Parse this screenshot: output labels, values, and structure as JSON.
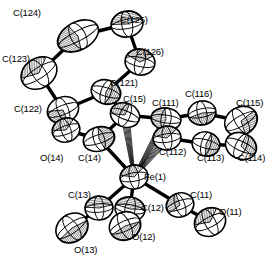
{
  "figure": {
    "kind": "ortep-crystal-structure-diagram",
    "title": "",
    "background_color": "#ffffff",
    "line_color": "#000000",
    "fill_color": "#ffffff",
    "width": 276,
    "height": 264,
    "ellipsoid_probability_note": ""
  },
  "atoms": [
    {
      "id": "C124",
      "label": "C(124)",
      "element": "C",
      "cx": 78,
      "cy": 36,
      "rx": 22,
      "ry": 14,
      "rot": -28,
      "hatch": "octant-left-dense",
      "label_x": 13,
      "label_y": 8,
      "label_anchor": "start"
    },
    {
      "id": "C125",
      "label": "C(125)",
      "element": "C",
      "cx": 127,
      "cy": 24,
      "rx": 16,
      "ry": 13,
      "rot": -10,
      "hatch": "octant-top-dense",
      "label_x": 120,
      "label_y": 15,
      "label_anchor": "start"
    },
    {
      "id": "C126",
      "label": "C(126)",
      "element": "C",
      "cx": 140,
      "cy": 62,
      "rx": 15,
      "ry": 13,
      "rot": 12,
      "hatch": "octant-center",
      "label_x": 136,
      "label_y": 47,
      "label_anchor": "start"
    },
    {
      "id": "C123",
      "label": "C(123)",
      "element": "C",
      "cx": 39,
      "cy": 73,
      "rx": 19,
      "ry": 15,
      "rot": -33,
      "hatch": "octant-center-dense",
      "label_x": 3,
      "label_y": 54,
      "label_anchor": "start"
    },
    {
      "id": "C122",
      "label": "C(122)",
      "element": "C",
      "cx": 63,
      "cy": 110,
      "rx": 16,
      "ry": 13,
      "rot": -22,
      "hatch": "octant-lower-left",
      "label_x": 14,
      "label_y": 104,
      "label_anchor": "start"
    },
    {
      "id": "C121",
      "label": "C(121)",
      "element": "C",
      "cx": 106,
      "cy": 92,
      "rx": 15,
      "ry": 12,
      "rot": 18,
      "hatch": "octant-right",
      "label_x": 110,
      "label_y": 78,
      "label_anchor": "start"
    },
    {
      "id": "C15",
      "label": "C(15)",
      "element": "C",
      "cx": 125,
      "cy": 115,
      "rx": 15,
      "ry": 12,
      "rot": 22,
      "hatch": "octant-upper-left",
      "label_x": 124,
      "label_y": 94,
      "label_anchor": "start"
    },
    {
      "id": "C111",
      "label": "C(111)",
      "element": "C",
      "cx": 166,
      "cy": 119,
      "rx": 15,
      "ry": 11,
      "rot": 8,
      "hatch": "octant-left-dense",
      "label_x": 152,
      "label_y": 98,
      "label_anchor": "start"
    },
    {
      "id": "C116",
      "label": "C(116)",
      "element": "C",
      "cx": 202,
      "cy": 113,
      "rx": 14,
      "ry": 12,
      "rot": -12,
      "hatch": "octant-lower-center",
      "label_x": 185,
      "label_y": 89,
      "label_anchor": "start"
    },
    {
      "id": "C115",
      "label": "C(115)",
      "element": "C",
      "cx": 241,
      "cy": 121,
      "rx": 17,
      "ry": 14,
      "rot": -30,
      "hatch": "octant-lower-right",
      "label_x": 236,
      "label_y": 98,
      "label_anchor": "start"
    },
    {
      "id": "C114",
      "label": "C(114)",
      "element": "C",
      "cx": 241,
      "cy": 146,
      "rx": 16,
      "ry": 13,
      "rot": 25,
      "hatch": "octant-upper-right",
      "label_x": 239,
      "label_y": 153,
      "label_anchor": "start"
    },
    {
      "id": "C113",
      "label": "C(113)",
      "element": "C",
      "cx": 206,
      "cy": 144,
      "rx": 14,
      "ry": 12,
      "rot": 15,
      "hatch": "octant-right-dense",
      "label_x": 198,
      "label_y": 153,
      "label_anchor": "start"
    },
    {
      "id": "C112",
      "label": "C(112)",
      "element": "C",
      "cx": 167,
      "cy": 138,
      "rx": 14,
      "ry": 12,
      "rot": -8,
      "hatch": "octant-center",
      "label_x": 160,
      "label_y": 147,
      "label_anchor": "start"
    },
    {
      "id": "C14",
      "label": "C(14)",
      "element": "C",
      "cx": 99,
      "cy": 139,
      "rx": 16,
      "ry": 12,
      "rot": -18,
      "hatch": "octant-right-light",
      "label_x": 79,
      "label_y": 153,
      "label_anchor": "start"
    },
    {
      "id": "O14",
      "label": "O(14)",
      "element": "O",
      "cx": 66,
      "cy": 130,
      "rx": 14,
      "ry": 12,
      "rot": -20,
      "hatch": "octant-center-dense",
      "label_x": 41,
      "label_y": 153,
      "label_anchor": "start"
    },
    {
      "id": "Fe1",
      "label": "Fe(1)",
      "element": "Fe",
      "cx": 134,
      "cy": 177,
      "rx": 14,
      "ry": 12,
      "rot": -10,
      "hatch": "octant-center",
      "label_x": 144,
      "label_y": 172,
      "label_anchor": "start"
    },
    {
      "id": "C13",
      "label": "C(13)",
      "element": "C",
      "cx": 99,
      "cy": 208,
      "rx": 14,
      "ry": 12,
      "rot": -5,
      "hatch": "octant-upper-band",
      "label_x": 69,
      "label_y": 190,
      "label_anchor": "start"
    },
    {
      "id": "O13",
      "label": "O(13)",
      "element": "O",
      "cx": 72,
      "cy": 228,
      "rx": 17,
      "ry": 14,
      "rot": -35,
      "hatch": "octant-lower-dense",
      "label_x": 74,
      "label_y": 245,
      "label_anchor": "start"
    },
    {
      "id": "C12",
      "label": "C(12)",
      "element": "C",
      "cx": 130,
      "cy": 209,
      "rx": 15,
      "ry": 12,
      "rot": 10,
      "hatch": "octant-upper-band",
      "label_x": 141,
      "label_y": 203,
      "label_anchor": "start"
    },
    {
      "id": "O12",
      "label": "O(12)",
      "element": "O",
      "cx": 125,
      "cy": 226,
      "rx": 16,
      "ry": 14,
      "rot": -25,
      "hatch": "octant-lower-dense",
      "label_x": 132,
      "label_y": 232,
      "label_anchor": "start"
    },
    {
      "id": "C11",
      "label": "C(11)",
      "element": "C",
      "cx": 180,
      "cy": 205,
      "rx": 14,
      "ry": 12,
      "rot": -20,
      "hatch": "octant-upper-left",
      "label_x": 190,
      "label_y": 190,
      "label_anchor": "start"
    },
    {
      "id": "O11",
      "label": "O(11)",
      "element": "O",
      "cx": 210,
      "cy": 222,
      "rx": 16,
      "ry": 14,
      "rot": -28,
      "hatch": "octant-center-dense",
      "label_x": 219,
      "label_y": 207,
      "label_anchor": "start"
    }
  ],
  "bonds": [
    {
      "from": "C124",
      "to": "C125",
      "style": "solid-thick"
    },
    {
      "from": "C125",
      "to": "C126",
      "style": "solid-thick"
    },
    {
      "from": "C126",
      "to": "C121",
      "style": "solid-thick"
    },
    {
      "from": "C121",
      "to": "C122",
      "style": "solid-thick"
    },
    {
      "from": "C122",
      "to": "C123",
      "style": "solid-thick"
    },
    {
      "from": "C123",
      "to": "C124",
      "style": "solid-thick"
    },
    {
      "from": "C121",
      "to": "C15",
      "style": "solid-thick"
    },
    {
      "from": "C15",
      "to": "C111",
      "style": "solid-thick"
    },
    {
      "from": "C111",
      "to": "C116",
      "style": "solid-thick"
    },
    {
      "from": "C116",
      "to": "C115",
      "style": "solid-thick"
    },
    {
      "from": "C115",
      "to": "C114",
      "style": "solid-thick"
    },
    {
      "from": "C114",
      "to": "C113",
      "style": "solid-thick"
    },
    {
      "from": "C113",
      "to": "C112",
      "style": "solid-thick"
    },
    {
      "from": "C112",
      "to": "C111",
      "style": "solid-thick"
    },
    {
      "from": "C15",
      "to": "C14",
      "style": "solid-thick"
    },
    {
      "from": "C14",
      "to": "O14",
      "style": "solid-thick"
    },
    {
      "from": "C14",
      "to": "Fe1",
      "style": "solid-thick"
    },
    {
      "from": "Fe1",
      "to": "C13",
      "style": "solid-thick"
    },
    {
      "from": "C13",
      "to": "O13",
      "style": "solid-thick"
    },
    {
      "from": "Fe1",
      "to": "C12",
      "style": "solid-thick"
    },
    {
      "from": "C12",
      "to": "O12",
      "style": "solid-thick"
    },
    {
      "from": "Fe1",
      "to": "C11",
      "style": "solid-thick"
    },
    {
      "from": "C11",
      "to": "O11",
      "style": "solid-thick"
    },
    {
      "from": "Fe1",
      "to": "C15",
      "style": "open-hash"
    },
    {
      "from": "Fe1",
      "to": "C111",
      "style": "open-hash"
    },
    {
      "from": "Fe1",
      "to": "C112",
      "style": "open-hash"
    }
  ],
  "labels": [
    {
      "id": "lbl-C124",
      "text": "C(124)",
      "x": 13,
      "y": 8
    },
    {
      "id": "lbl-C125",
      "text": "C(125)",
      "x": 120,
      "y": 15
    },
    {
      "id": "lbl-C126",
      "text": "C(126)",
      "x": 136,
      "y": 47
    },
    {
      "id": "lbl-C123",
      "text": "C(123)",
      "x": 2,
      "y": 54
    },
    {
      "id": "lbl-C122",
      "text": "C(122)",
      "x": 14,
      "y": 104
    },
    {
      "id": "lbl-C121",
      "text": "C(121)",
      "x": 110,
      "y": 78
    },
    {
      "id": "lbl-C15",
      "text": "C(15)",
      "x": 123,
      "y": 94
    },
    {
      "id": "lbl-C111",
      "text": "C(111)",
      "x": 152,
      "y": 98
    },
    {
      "id": "lbl-C116",
      "text": "C(116)",
      "x": 185,
      "y": 89
    },
    {
      "id": "lbl-C115",
      "text": "C(115)",
      "x": 236,
      "y": 98
    },
    {
      "id": "lbl-C114",
      "text": "C(114)",
      "x": 238,
      "y": 153
    },
    {
      "id": "lbl-C113",
      "text": "C(113)",
      "x": 197,
      "y": 153
    },
    {
      "id": "lbl-C112",
      "text": "C(112)",
      "x": 159,
      "y": 147
    },
    {
      "id": "lbl-C14",
      "text": "C(14)",
      "x": 78,
      "y": 153
    },
    {
      "id": "lbl-O14",
      "text": "O(14)",
      "x": 40,
      "y": 153
    },
    {
      "id": "lbl-Fe1",
      "text": "Fe(1)",
      "x": 144,
      "y": 172
    },
    {
      "id": "lbl-C13",
      "text": "C(13)",
      "x": 68,
      "y": 190
    },
    {
      "id": "lbl-O13",
      "text": "O(13)",
      "x": 74,
      "y": 245
    },
    {
      "id": "lbl-C12",
      "text": "C(12)",
      "x": 141,
      "y": 203
    },
    {
      "id": "lbl-O12",
      "text": "O(12)",
      "x": 132,
      "y": 232
    },
    {
      "id": "lbl-C11",
      "text": "C(11)",
      "x": 190,
      "y": 190
    },
    {
      "id": "lbl-O11",
      "text": "O(11)",
      "x": 219,
      "y": 207
    }
  ]
}
